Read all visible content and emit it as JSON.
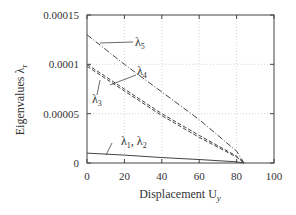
{
  "chart_data": {
    "type": "line",
    "title": "",
    "xlabel": "Displacement  U",
    "xlabel_sub": "y",
    "ylabel": "Eigenvalues  λ",
    "ylabel_sub": "r",
    "xlim": [
      0,
      100
    ],
    "ylim": [
      0,
      0.00015
    ],
    "xticks": [
      "0",
      "20",
      "40",
      "60",
      "80",
      "100"
    ],
    "yticks": [
      "0",
      "0.00005",
      "0.0001",
      "0.00015"
    ],
    "grid": true,
    "series": [
      {
        "name": "λ5",
        "style": "dash-dot",
        "x": [
          0,
          20,
          40,
          60,
          80,
          84
        ],
        "y": [
          0.00013,
          0.0001,
          7.2e-05,
          4.4e-05,
          1.2e-05,
          0
        ]
      },
      {
        "name": "λ4",
        "style": "dashed",
        "x": [
          0,
          20,
          40,
          60,
          80,
          84
        ],
        "y": [
          0.0001,
          7.5e-05,
          5e-05,
          2.8e-05,
          7e-06,
          0
        ]
      },
      {
        "name": "λ3",
        "style": "dashed",
        "x": [
          0,
          20,
          40,
          60,
          80,
          84
        ],
        "y": [
          9.8e-05,
          7.3e-05,
          4.8e-05,
          2.6e-05,
          6e-06,
          0
        ]
      },
      {
        "name": "λ1, λ2",
        "style": "solid",
        "x": [
          0,
          20,
          40,
          60,
          80,
          84
        ],
        "y": [
          1e-05,
          8e-06,
          5.5e-06,
          3.5e-06,
          1.2e-06,
          0
        ]
      }
    ],
    "annotations": [
      "λ5",
      "λ4",
      "λ3",
      "λ1, λ2"
    ]
  }
}
